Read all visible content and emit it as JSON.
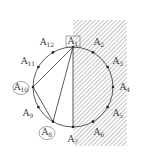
{
  "diagram": {
    "title": "",
    "circle": {
      "cx": 73,
      "cy": 87,
      "r": 40
    },
    "shaded_region": {
      "x": 73,
      "y": 20,
      "width": 54,
      "height": 126,
      "pattern": "diagonal-hatch"
    },
    "points": [
      {
        "id": "A1",
        "base": "A",
        "sub": "1",
        "angle": 90,
        "mark": "box"
      },
      {
        "id": "A2",
        "base": "A",
        "sub": "2",
        "angle": 60
      },
      {
        "id": "A3",
        "base": "A",
        "sub": "3",
        "angle": 30
      },
      {
        "id": "A4",
        "base": "A",
        "sub": "4",
        "angle": 0
      },
      {
        "id": "A5",
        "base": "A",
        "sub": "5",
        "angle": -30
      },
      {
        "id": "A6",
        "base": "A",
        "sub": "6",
        "angle": -60
      },
      {
        "id": "A7",
        "base": "A",
        "sub": "7",
        "angle": -90
      },
      {
        "id": "A8",
        "base": "A",
        "sub": "8",
        "angle": -120,
        "mark": "circle"
      },
      {
        "id": "A9",
        "base": "A",
        "sub": "9",
        "angle": -150
      },
      {
        "id": "A10",
        "base": "A",
        "sub": "10",
        "angle": 180,
        "mark": "circle"
      },
      {
        "id": "A11",
        "base": "A",
        "sub": "11",
        "angle": 150
      },
      {
        "id": "A12",
        "base": "A",
        "sub": "12",
        "angle": 120
      }
    ],
    "segments": [
      [
        "A1",
        "A10"
      ],
      [
        "A10",
        "A8"
      ],
      [
        "A8",
        "A1"
      ],
      [
        "A1",
        "A7"
      ]
    ],
    "colors": {
      "stroke": "#333333",
      "hatch": "#555555",
      "background": "#ffffff"
    }
  }
}
